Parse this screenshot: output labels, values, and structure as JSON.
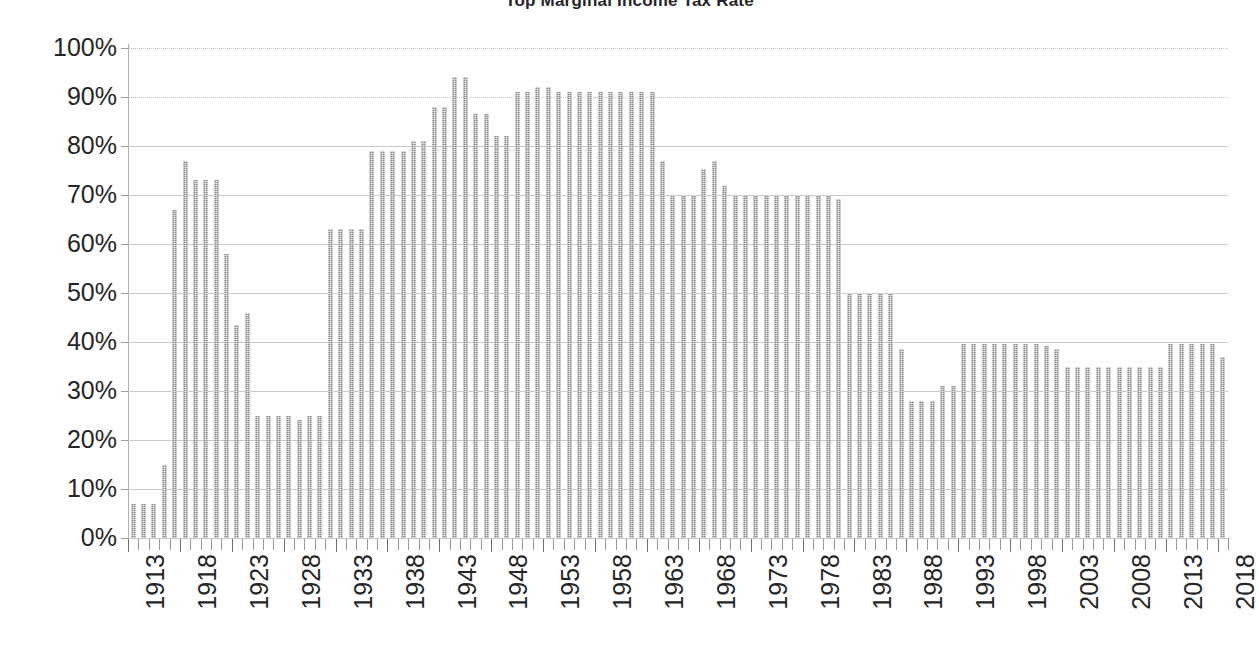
{
  "chart_title": "Top Marginal Income Tax Rate",
  "axes": {
    "y_tick_labels": [
      "100%",
      "90%",
      "80%",
      "70%",
      "60%",
      "50%",
      "40%",
      "30%",
      "20%",
      "10%",
      "0%"
    ],
    "x_tick_labels": [
      "1913",
      "1918",
      "1923",
      "1928",
      "1933",
      "1938",
      "1943",
      "1948",
      "1953",
      "1958",
      "1963",
      "1968",
      "1973",
      "1978",
      "1983",
      "1988",
      "1993",
      "1998",
      "2003",
      "2008",
      "2013",
      "2018"
    ]
  },
  "style": {
    "bar_color": "#8c8c8c",
    "gridline_color": "#c9c9c9",
    "axis_color": "#7f7f7f",
    "text_color": "#262626",
    "background": "#ffffff"
  },
  "chart_data": {
    "type": "bar",
    "title": "Top Marginal Income Tax Rate",
    "xlabel": "",
    "ylabel": "",
    "ylim": [
      0,
      100
    ],
    "ytick_step": 10,
    "grid": true,
    "legend": "none",
    "unit": "percent",
    "categories": [
      "1913",
      "1914",
      "1915",
      "1916",
      "1917",
      "1918",
      "1919",
      "1920",
      "1921",
      "1922",
      "1923",
      "1924",
      "1925",
      "1926",
      "1927",
      "1928",
      "1929",
      "1930",
      "1931",
      "1932",
      "1933",
      "1934",
      "1935",
      "1936",
      "1937",
      "1938",
      "1939",
      "1940",
      "1941",
      "1942",
      "1943",
      "1944",
      "1945",
      "1946",
      "1947",
      "1948",
      "1949",
      "1950",
      "1951",
      "1952",
      "1953",
      "1954",
      "1955",
      "1956",
      "1957",
      "1958",
      "1959",
      "1960",
      "1961",
      "1962",
      "1963",
      "1964",
      "1965",
      "1966",
      "1967",
      "1968",
      "1969",
      "1970",
      "1971",
      "1972",
      "1973",
      "1974",
      "1975",
      "1976",
      "1977",
      "1978",
      "1979",
      "1980",
      "1981",
      "1982",
      "1983",
      "1984",
      "1985",
      "1986",
      "1987",
      "1988",
      "1989",
      "1990",
      "1991",
      "1992",
      "1993",
      "1994",
      "1995",
      "1996",
      "1997",
      "1998",
      "1999",
      "2000",
      "2001",
      "2002",
      "2003",
      "2004",
      "2005",
      "2006",
      "2007",
      "2008",
      "2009",
      "2010",
      "2011",
      "2012",
      "2013",
      "2014",
      "2015",
      "2016",
      "2017",
      "2018"
    ],
    "values": [
      7,
      7,
      7,
      15,
      67,
      77,
      73,
      73,
      73,
      58,
      43.5,
      46,
      25,
      25,
      25,
      25,
      24,
      25,
      25,
      63,
      63,
      63,
      63,
      79,
      79,
      79,
      79,
      81.1,
      81,
      88,
      88,
      94,
      94,
      86.45,
      86.45,
      82.13,
      82.13,
      91,
      91,
      92,
      92,
      91,
      91,
      91,
      91,
      91,
      91,
      91,
      91,
      91,
      91,
      77,
      70,
      70,
      70,
      75.25,
      77,
      71.75,
      70,
      70,
      70,
      70,
      70,
      70,
      70,
      70,
      70,
      70,
      69.125,
      50,
      50,
      50,
      50,
      50,
      38.5,
      28,
      28,
      28,
      31,
      31,
      39.6,
      39.6,
      39.6,
      39.6,
      39.6,
      39.6,
      39.6,
      39.6,
      39.1,
      38.6,
      35,
      35,
      35,
      35,
      35,
      35,
      35,
      35,
      35,
      35,
      39.6,
      39.6,
      39.6,
      39.6,
      39.6,
      37
    ]
  }
}
